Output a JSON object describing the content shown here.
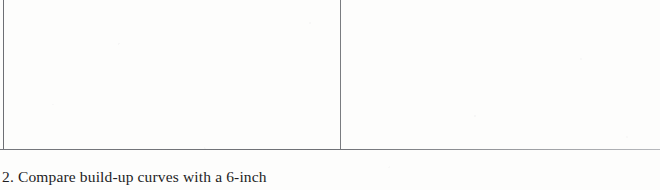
{
  "page": {
    "width": 660,
    "height": 190,
    "background_color": "#fdfdfc",
    "kind": "scanned-document-fragment"
  },
  "figure": {
    "frame": {
      "rule_color": "#6e7075",
      "border_color": "#6d6f74",
      "divider_color": "#7a7c80",
      "left_edge_x": 3,
      "divider_x": 340,
      "bottom_rule_y": 149
    },
    "cells": [
      {
        "name": "left-panel",
        "content": "",
        "x": 3,
        "width": 337
      },
      {
        "name": "right-panel",
        "content": "",
        "x": 340,
        "width": 320
      }
    ]
  },
  "caption": {
    "number": "2.",
    "text": "Compare build-up curves with a 6-inch",
    "full": "2. Compare build-up curves with a 6-inch"
  }
}
